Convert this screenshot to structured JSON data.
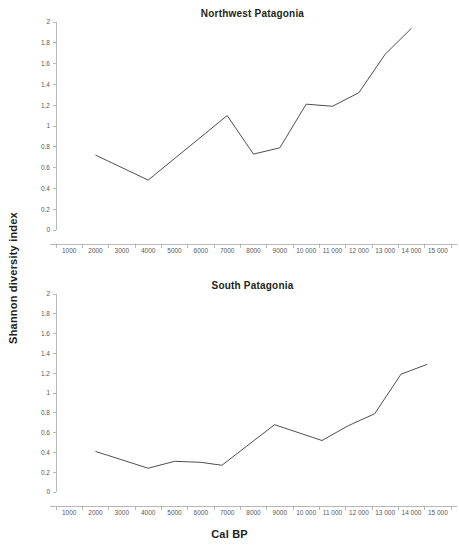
{
  "figure": {
    "axis_title_y": "Shannon diversity index",
    "axis_title_x": "Cal BP",
    "line_color": "#3a3a3a",
    "axis_color": "#a6a6a6",
    "tick_label_color": "#58595b",
    "background": "#ffffff"
  },
  "panels": [
    {
      "id": "northwest-patagonia",
      "title": "Northwest Patagonia"
    },
    {
      "id": "south-patagonia",
      "title": "South Patagonia"
    }
  ],
  "axes": {
    "y_ticks": [
      "0",
      "0.2",
      "0.4",
      "0.6",
      "0.8",
      "1",
      "1.2",
      "1.4",
      "1.6",
      "1.8",
      "2"
    ],
    "y_tick_values": [
      0,
      0.2,
      0.4,
      0.6,
      0.8,
      1,
      1.2,
      1.4,
      1.6,
      1.8,
      2
    ],
    "x_ticks": [
      "1000",
      "2000",
      "3000",
      "4000",
      "5000",
      "6000",
      "7000",
      "8000",
      "9000",
      "10 000",
      "11 000",
      "12 000",
      "13 000",
      "14 000",
      "15 000"
    ],
    "x_tick_values": [
      1000,
      2000,
      3000,
      4000,
      5000,
      6000,
      7000,
      8000,
      9000,
      10000,
      11000,
      12000,
      13000,
      14000,
      15000
    ]
  },
  "chart_data": [
    {
      "type": "line",
      "title": "Northwest Patagonia",
      "xlabel": "Cal BP",
      "ylabel": "Shannon diversity index",
      "xlim": [
        500,
        15500
      ],
      "ylim": [
        0,
        2
      ],
      "grid": false,
      "legend": "none",
      "x": [
        2000,
        4000,
        7000,
        8000,
        9000,
        10000,
        11000,
        12000,
        13000,
        14000
      ],
      "y": [
        0.72,
        0.48,
        1.1,
        0.73,
        0.79,
        1.21,
        1.19,
        1.32,
        1.69,
        1.94
      ],
      "series": [
        {
          "name": "Northwest Patagonia",
          "points": [
            {
              "x": 2000,
              "y": 0.72
            },
            {
              "x": 4000,
              "y": 0.48
            },
            {
              "x": 7000,
              "y": 1.1
            },
            {
              "x": 8000,
              "y": 0.73
            },
            {
              "x": 9000,
              "y": 0.79
            },
            {
              "x": 10000,
              "y": 1.21
            },
            {
              "x": 11000,
              "y": 1.19
            },
            {
              "x": 12000,
              "y": 1.32
            },
            {
              "x": 13000,
              "y": 1.69
            },
            {
              "x": 14000,
              "y": 1.94
            }
          ]
        }
      ]
    },
    {
      "type": "line",
      "title": "South Patagonia",
      "xlabel": "Cal BP",
      "ylabel": "Shannon diversity index",
      "xlim": [
        500,
        15500
      ],
      "ylim": [
        0,
        2
      ],
      "grid": false,
      "legend": "none",
      "x": [
        2000,
        4000,
        5000,
        6000,
        6800,
        8800,
        10600,
        11600,
        12600,
        13600,
        14600
      ],
      "y": [
        0.41,
        0.24,
        0.31,
        0.3,
        0.27,
        0.68,
        0.52,
        0.67,
        0.79,
        1.19,
        1.29
      ],
      "series": [
        {
          "name": "South Patagonia",
          "points": [
            {
              "x": 2000,
              "y": 0.41
            },
            {
              "x": 4000,
              "y": 0.24
            },
            {
              "x": 5000,
              "y": 0.31
            },
            {
              "x": 6000,
              "y": 0.3
            },
            {
              "x": 6800,
              "y": 0.27
            },
            {
              "x": 8800,
              "y": 0.68
            },
            {
              "x": 10600,
              "y": 0.52
            },
            {
              "x": 11600,
              "y": 0.67
            },
            {
              "x": 12600,
              "y": 0.79
            },
            {
              "x": 13600,
              "y": 1.19
            },
            {
              "x": 14600,
              "y": 1.29
            }
          ]
        }
      ]
    }
  ]
}
